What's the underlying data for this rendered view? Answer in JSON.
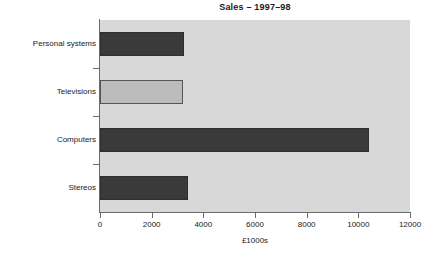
{
  "chart_data": {
    "type": "bar",
    "orientation": "horizontal",
    "title": "Sales – 1997–98",
    "xlabel": "£1000s",
    "ylabel": "",
    "categories": [
      "Personal systems",
      "Televisions",
      "Computers",
      "Stereos"
    ],
    "values": [
      3250,
      3200,
      10400,
      3400
    ],
    "series": [
      {
        "name": "Sales",
        "values": [
          3250,
          3200,
          10400,
          3400
        ]
      }
    ],
    "xlim": [
      0,
      12000
    ],
    "xticks": [
      0,
      2000,
      4000,
      6000,
      8000,
      10000,
      12000
    ],
    "xtick_labels": [
      "0",
      "2000",
      "4000",
      "6000",
      "8000",
      "10000",
      "12000"
    ],
    "grid": false,
    "legend": false,
    "bar_colors": [
      "#3a3a3a",
      "#bcbcbc",
      "#3a3a3a",
      "#3a3a3a"
    ],
    "plot_background": "#d8d8d8",
    "page_background": "#ffffff",
    "axis_color": "#6b6b6b"
  }
}
